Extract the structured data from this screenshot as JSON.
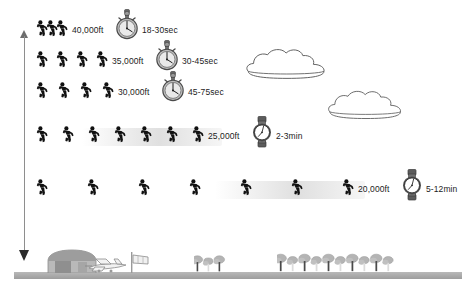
{
  "diagram": {
    "axis": {
      "name": "altitude-axis",
      "direction": "vertical-double-arrow",
      "color": "#8e8e8e"
    },
    "rows": [
      {
        "id": "row-40000",
        "altitude": "40,000ft",
        "time": "18-30sec",
        "timer_icon": "stopwatch-icon",
        "faller_count": 3,
        "faller_icon": "skydiver-freefall-icon",
        "faller_xs": [
          36,
          46,
          56
        ],
        "y": 20,
        "trail": null
      },
      {
        "id": "row-35000",
        "altitude": "35,000ft",
        "time": "30-45sec",
        "timer_icon": "stopwatch-icon",
        "faller_count": 4,
        "faller_icon": "skydiver-freefall-icon",
        "faller_xs": [
          36,
          56,
          76,
          96
        ],
        "y": 51,
        "trail": null
      },
      {
        "id": "row-30000",
        "altitude": "30,000ft",
        "time": "45-75sec",
        "timer_icon": "stopwatch-icon",
        "faller_count": 4,
        "faller_icon": "skydiver-freefall-icon",
        "faller_xs": [
          36,
          58,
          80,
          102
        ],
        "y": 82,
        "trail": null
      },
      {
        "id": "row-25000",
        "altitude": "25,000ft",
        "time": "2-3min",
        "timer_icon": "wristwatch-icon",
        "faller_count": 7,
        "faller_icon": "skydiver-freefall-icon",
        "faller_xs": [
          36,
          62,
          88,
          114,
          140,
          166,
          192
        ],
        "y": 126,
        "trail": {
          "x": 82,
          "width": 140
        }
      },
      {
        "id": "row-20000",
        "altitude": "20,000ft",
        "time": "5-12min",
        "timer_icon": "wristwatch-icon",
        "faller_count": 7,
        "faller_icon": "skydiver-freefall-icon",
        "faller_xs": [
          36,
          87,
          138,
          189,
          240,
          291,
          342
        ],
        "y": 179,
        "trail": {
          "x": 215,
          "width": 150
        }
      }
    ],
    "clouds": [
      {
        "name": "cloud-upper",
        "x": 243,
        "y": 46,
        "w": 88,
        "h": 35
      },
      {
        "name": "cloud-lower",
        "x": 325,
        "y": 88,
        "w": 82,
        "h": 33
      }
    ],
    "ground_scene": {
      "ground_label": "airfield-ground-line",
      "items": [
        {
          "name": "hangar-icon",
          "x": 46,
          "y": 249,
          "w": 52,
          "h": 24
        },
        {
          "name": "airplane-icon",
          "x": 83,
          "y": 258,
          "w": 46,
          "h": 15
        },
        {
          "name": "windsock-icon",
          "x": 130,
          "y": 252,
          "w": 22,
          "h": 21
        },
        {
          "name": "tree-cluster-left-icon",
          "x": 194,
          "y": 252,
          "w": 38,
          "h": 21
        },
        {
          "name": "tree-cluster-right-icon",
          "x": 277,
          "y": 250,
          "w": 125,
          "h": 23
        }
      ]
    },
    "colors": {
      "ink": "#1c1c1c",
      "axis": "#8e8e8e",
      "trail": "#dedede",
      "ground": "#a8a8a8",
      "cloud_stroke": "#5e5e5e",
      "scene_fill": "#b3b3b3"
    }
  }
}
